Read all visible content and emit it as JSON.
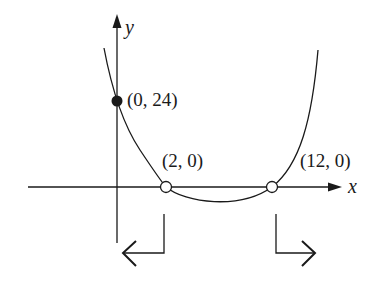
{
  "figure": {
    "type": "function-graph",
    "axes": {
      "x_label": "x",
      "y_label": "y"
    },
    "points": [
      {
        "label": "(0, 24)",
        "x": 0,
        "y": 24,
        "style": "filled"
      },
      {
        "label": "(2, 0)",
        "x": 2,
        "y": 0,
        "style": "open"
      },
      {
        "label": "(12, 0)",
        "x": 12,
        "y": 0,
        "style": "open"
      }
    ],
    "intervals": [
      {
        "direction": "left",
        "from": 2,
        "meaning": "x < 2"
      },
      {
        "direction": "right",
        "from": 12,
        "meaning": "x > 12"
      }
    ],
    "colors": {
      "ink": "#1a1a1a",
      "background": "#ffffff"
    }
  }
}
